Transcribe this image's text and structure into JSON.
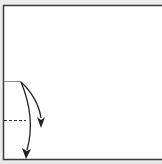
{
  "diagram": {
    "type": "fold-diagram",
    "paper": {
      "fill": "#ffffff",
      "border_color": "#333333",
      "edges_visible": [
        "top",
        "left",
        "bottom"
      ]
    },
    "lines": [
      {
        "name": "crease-line",
        "style": "solid-thin",
        "color": "#888888"
      },
      {
        "name": "valley-fold-line",
        "style": "dashed",
        "color": "#333333"
      }
    ],
    "arrows": [
      {
        "name": "fold-arrow-short",
        "direction": "down-right",
        "color": "#222222"
      },
      {
        "name": "fold-arrow-long",
        "direction": "down",
        "color": "#222222"
      }
    ],
    "background": "#ebebeb"
  }
}
